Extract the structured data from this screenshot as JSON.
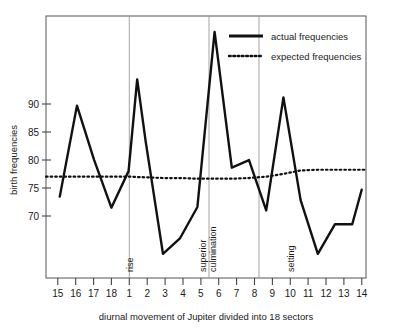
{
  "chart_data": {
    "type": "line",
    "title": "",
    "xlabel": "diurnal movement of Jupiter divided into 18 sectors",
    "ylabel": "birth frequencies",
    "categories": [
      "15",
      "16",
      "17",
      "18",
      "1",
      "2",
      "3",
      "4",
      "5",
      "6",
      "7",
      "8",
      "9",
      "10",
      "11",
      "12",
      "13",
      "14"
    ],
    "xlim": [
      0.2,
      18.8
    ],
    "ylim": [
      63.5,
      101.5
    ],
    "yticks": [
      70,
      75,
      80,
      85,
      90
    ],
    "ytick_labels": [
      "70",
      "75",
      "80",
      "85",
      "90"
    ],
    "grid": false,
    "legend_position": "top-right",
    "series": [
      {
        "name": "actual frequencies",
        "style": "solid",
        "values": [
          75.3,
          88.5,
          80.6,
          73.7,
          79.0,
          83.2,
          67.0,
          69.3,
          73.8,
          99.2,
          79.5,
          80.6,
          73.3,
          89.7,
          74.8,
          67.0,
          71.3,
          71.3
        ],
        "extra_points": [
          {
            "x": 5.5,
            "y": 92.3,
            "note": "peak between sectors 1 and 2"
          },
          {
            "x": 18.55,
            "y": 76.3,
            "note": "final rise at right edge"
          }
        ]
      },
      {
        "name": "expected frequencies",
        "style": "dotted",
        "values": [
          78.2,
          78.2,
          78.2,
          78.2,
          78.2,
          78.1,
          78.0,
          78.0,
          77.9,
          77.9,
          77.9,
          78.0,
          78.2,
          78.6,
          79.1,
          79.2,
          79.2,
          79.2
        ]
      }
    ],
    "annotations": [
      {
        "label": "rise",
        "x_sector": "1",
        "x_value": 5.0
      },
      {
        "label": "superior culmination",
        "line1": "superior",
        "line2": "culmination",
        "x_sector": "5/6",
        "x_value": 10.5
      },
      {
        "label": "setting",
        "x_sector": "10",
        "x_value": 14.0
      }
    ]
  },
  "legend": {
    "items": [
      {
        "label": "actual frequencies",
        "style": "solid",
        "swatch": "solid-line-swatch"
      },
      {
        "label": "expected frequencies",
        "style": "dotted",
        "swatch": "dotted-line-swatch"
      }
    ]
  },
  "axes": {
    "y_axis_title": "birth frequencies",
    "x_axis_title": "diurnal movement of Jupiter divided into 18 sectors",
    "y_tick_labels": [
      "90",
      "85",
      "80",
      "75",
      "70"
    ],
    "x_tick_labels": [
      "15",
      "16",
      "17",
      "18",
      "1",
      "2",
      "3",
      "4",
      "5",
      "6",
      "7",
      "8",
      "9",
      "10",
      "11",
      "12",
      "13",
      "14"
    ]
  },
  "colors": {
    "ink": "#111111",
    "frame": "#555555",
    "guide": "#9a9a9a",
    "background": "#ffffff"
  }
}
